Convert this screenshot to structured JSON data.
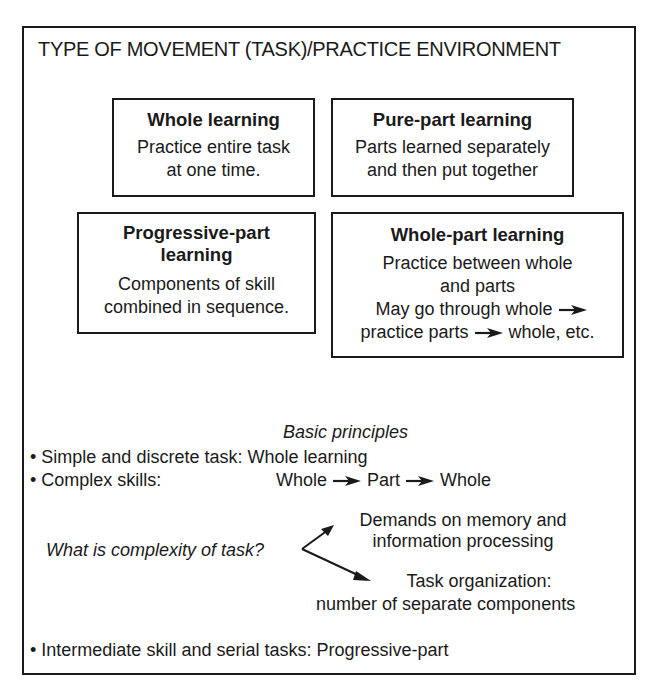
{
  "title": "TYPE OF MOVEMENT (TASK)/PRACTICE ENVIRONMENT",
  "boxes": {
    "whole": {
      "heading": "Whole learning",
      "lines": [
        "Practice entire task",
        "at one time."
      ]
    },
    "pure_part": {
      "heading": "Pure-part learning",
      "lines": [
        "Parts learned separately",
        "and then put together"
      ]
    },
    "progressive_part": {
      "heading_lines": [
        "Progressive-part",
        "learning"
      ],
      "lines": [
        "Components of skill",
        "combined in sequence."
      ]
    },
    "whole_part": {
      "heading": "Whole-part learning",
      "lines": [
        "Practice between whole",
        "and parts"
      ],
      "flow_line1": "May go through whole",
      "flow_line2_a": "practice parts",
      "flow_line2_b": "whole, etc."
    }
  },
  "principles": {
    "heading": "Basic principles",
    "bullet": "•",
    "item1_label": "Simple and discrete task:",
    "item1_value": "Whole learning",
    "item2_label": "Complex skills:",
    "item2_flow": [
      "Whole",
      "Part",
      "Whole"
    ],
    "question": "What is complexity of task?",
    "branch1_lines": [
      "Demands on memory and",
      "information processing"
    ],
    "branch2_lines": [
      "Task organization:",
      "number of separate components"
    ],
    "item3": "Intermediate skill and serial tasks: Progressive-part"
  }
}
